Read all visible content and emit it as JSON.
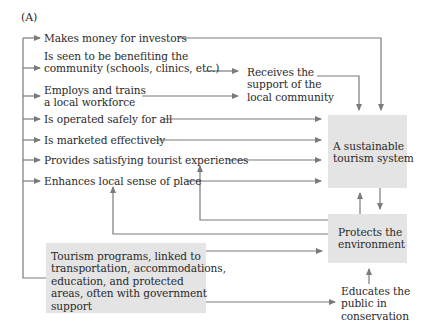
{
  "panel_label": "(A)",
  "left_items": [
    {
      "id": "investors",
      "lines": [
        "Makes money for investors"
      ]
    },
    {
      "id": "community",
      "lines": [
        "Is seen to be benefiting the",
        "community (schools, clinics, etc.)"
      ]
    },
    {
      "id": "workforce",
      "lines": [
        "Employs and trains",
        "a local workforce"
      ]
    },
    {
      "id": "safety",
      "lines": [
        "Is operated safely for all"
      ]
    },
    {
      "id": "marketing",
      "lines": [
        "Is marketed effectively"
      ]
    },
    {
      "id": "experiences",
      "lines": [
        "Provides satisfying tourist experiences"
      ]
    },
    {
      "id": "place",
      "lines": [
        "Enhances local sense of place"
      ]
    }
  ],
  "support_node": {
    "lines": [
      "Receives the",
      "support of the",
      "local community"
    ]
  },
  "sustainable_box": {
    "lines": [
      "A sustainable",
      "tourism system"
    ]
  },
  "environment_box": {
    "lines": [
      "Protects the",
      "environment"
    ]
  },
  "programs_box": {
    "lines": [
      "Tourism programs, linked to",
      "transportation, accommodations,",
      "education, and protected",
      "areas, often with government",
      "support"
    ]
  },
  "educates_node": {
    "lines": [
      "Educates the",
      "public in",
      "conservation"
    ]
  },
  "colors": {
    "box_fill": "#e4e4e4",
    "line": "#7a7a7a",
    "text": "#2a2a2a"
  }
}
